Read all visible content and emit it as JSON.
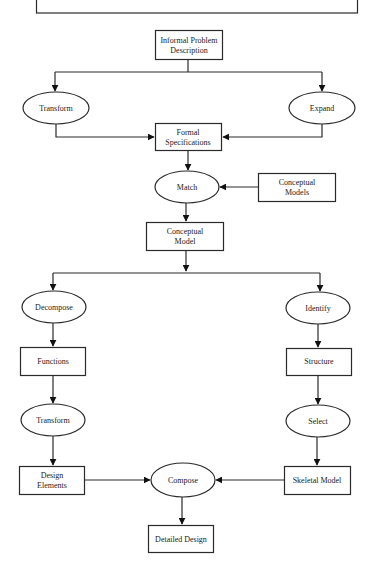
{
  "diagram": {
    "type": "flowchart",
    "colors": {
      "stroke": "#2a2a2a",
      "arrow": "#111111",
      "background": "#ffffff",
      "text": "#222222"
    },
    "nodes": {
      "informal_problem": {
        "shape": "box",
        "line1": "Informal Problem",
        "line2": "Description"
      },
      "transform_top": {
        "shape": "ellipse",
        "label": "Transform"
      },
      "expand": {
        "shape": "ellipse",
        "label": "Expand"
      },
      "formal_specs": {
        "shape": "box",
        "line1": "Formal",
        "line2": "Specifications"
      },
      "match": {
        "shape": "ellipse",
        "label": "Match"
      },
      "conceptual_models": {
        "shape": "box",
        "line1": "Conceptual",
        "line2": "Models"
      },
      "conceptual_model": {
        "shape": "box",
        "line1": "Conceptual",
        "line2": "Model"
      },
      "decompose": {
        "shape": "ellipse",
        "label": "Decompose"
      },
      "identify": {
        "shape": "ellipse",
        "label": "Identify"
      },
      "functions": {
        "shape": "box",
        "label": "Functions"
      },
      "structure": {
        "shape": "box",
        "label": "Structure"
      },
      "transform_bottom": {
        "shape": "ellipse",
        "label": "Transform"
      },
      "select": {
        "shape": "ellipse",
        "label": "Select"
      },
      "design_elements": {
        "shape": "box",
        "line1": "Design",
        "line2": "Elements"
      },
      "compose": {
        "shape": "ellipse",
        "label": "Compose"
      },
      "skeletal_model": {
        "shape": "box",
        "label": "Skeletal Model"
      },
      "detailed_design": {
        "shape": "box",
        "label": "Detailed Design"
      }
    },
    "edges": [
      {
        "from": "Informal Problem Description",
        "to": "Transform"
      },
      {
        "from": "Informal Problem Description",
        "to": "Expand"
      },
      {
        "from": "Transform",
        "to": "Formal Specifications"
      },
      {
        "from": "Expand",
        "to": "Formal Specifications"
      },
      {
        "from": "Formal Specifications",
        "to": "Match"
      },
      {
        "from": "Conceptual Models",
        "to": "Match"
      },
      {
        "from": "Match",
        "to": "Conceptual Model"
      },
      {
        "from": "Conceptual Model",
        "to": "Decompose"
      },
      {
        "from": "Conceptual Model",
        "to": "Identify"
      },
      {
        "from": "Decompose",
        "to": "Functions"
      },
      {
        "from": "Functions",
        "to": "Transform"
      },
      {
        "from": "Transform",
        "to": "Design Elements"
      },
      {
        "from": "Identify",
        "to": "Structure"
      },
      {
        "from": "Structure",
        "to": "Select"
      },
      {
        "from": "Select",
        "to": "Skeletal Model"
      },
      {
        "from": "Design Elements",
        "to": "Compose"
      },
      {
        "from": "Skeletal Model",
        "to": "Compose"
      },
      {
        "from": "Compose",
        "to": "Detailed Design"
      }
    ]
  }
}
